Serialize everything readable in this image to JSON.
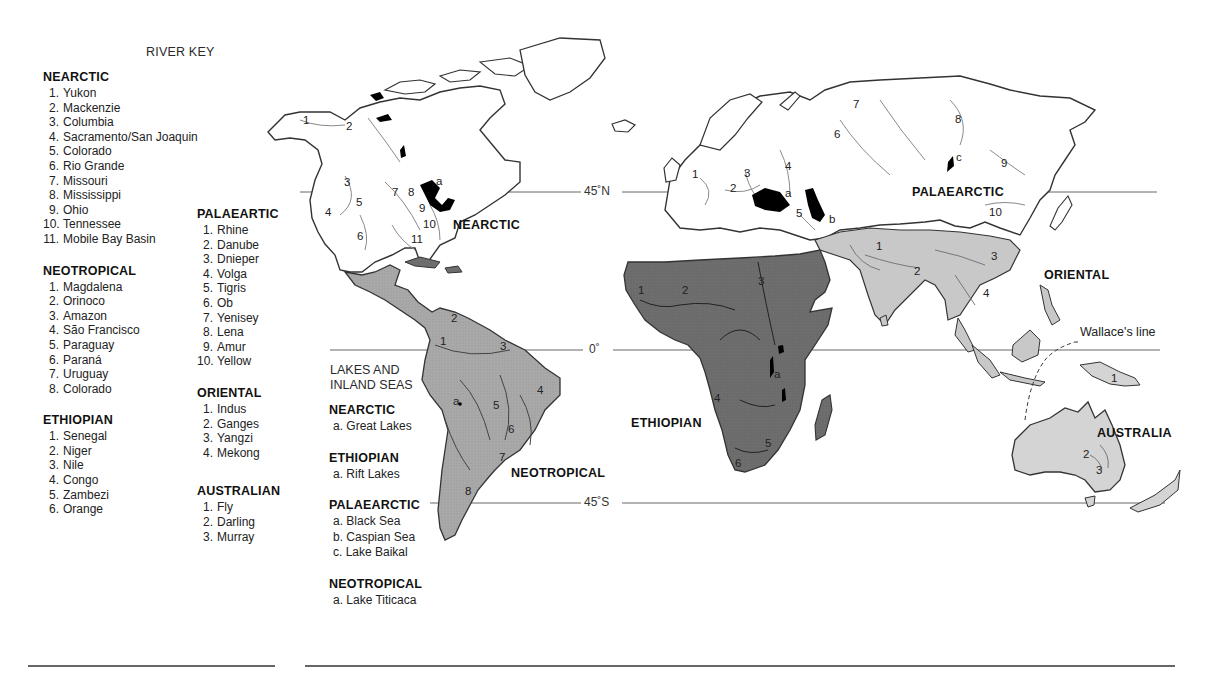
{
  "river_key": {
    "title": "RIVER KEY",
    "realms": [
      {
        "name": "NEARCTIC",
        "rivers": [
          "Yukon",
          "Mackenzie",
          "Columbia",
          "Sacramento/San Joaquin",
          "Colorado",
          "Rio Grande",
          "Missouri",
          "Mississippi",
          "Ohio",
          "Tennessee",
          "Mobile Bay Basin"
        ]
      },
      {
        "name": "NEOTROPICAL",
        "rivers": [
          "Magdalena",
          "Orinoco",
          "Amazon",
          "São Francisco",
          "Paraguay",
          "Paraná",
          "Uruguay",
          "Colorado"
        ]
      },
      {
        "name": "ETHIOPIAN",
        "rivers": [
          "Senegal",
          "Niger",
          "Nile",
          "Congo",
          "Zambezi",
          "Orange"
        ]
      },
      {
        "name": "PALAEARTIC",
        "rivers": [
          "Rhine",
          "Danube",
          "Dnieper",
          "Volga",
          "Tigris",
          "Ob",
          "Yenisey",
          "Lena",
          "Amur",
          "Yellow"
        ]
      },
      {
        "name": "ORIENTAL",
        "rivers": [
          "Indus",
          "Ganges",
          "Yangzi",
          "Mekong"
        ]
      },
      {
        "name": "AUSTRALIAN",
        "rivers": [
          "Fly",
          "Darling",
          "Murray"
        ]
      }
    ]
  },
  "lakes_key": {
    "title_line1": "LAKES AND",
    "title_line2": "INLAND SEAS",
    "realms": [
      {
        "name": "NEARCTIC",
        "lakes": [
          "a. Great Lakes"
        ]
      },
      {
        "name": "ETHIOPIAN",
        "lakes": [
          "a. Rift Lakes"
        ]
      },
      {
        "name": "PALAEARCTIC",
        "lakes": [
          "a. Black Sea",
          "b. Caspian Sea",
          "c. Lake Baikal"
        ]
      },
      {
        "name": "NEOTROPICAL",
        "lakes": [
          "a. Lake Titicaca"
        ]
      }
    ]
  },
  "map": {
    "realm_labels": {
      "nearctic": "NEARCTIC",
      "neotropical": "NEOTROPICAL",
      "ethiopian": "ETHIOPIAN",
      "palaearctic": "PALAEARCTIC",
      "oriental": "ORIENTAL",
      "australia": "AUSTRALIA"
    },
    "latitudes": {
      "n45": "45˚N",
      "eq": "0˚",
      "s45": "45˚S"
    },
    "wallace_line": "Wallace's line",
    "colors": {
      "ethiopian": "#6e6e6e",
      "neotropical": "#a9a9a9",
      "oriental": "#c8c8c8",
      "australian": "#d4d4d4",
      "lakes": "#000000",
      "coast": "#333333",
      "river": "#8a8a8a"
    }
  }
}
